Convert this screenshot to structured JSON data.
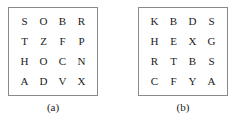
{
  "figure": {
    "panels": [
      {
        "id": "a",
        "caption": "(a)",
        "grid": {
          "rows": 4,
          "cols": 4,
          "cells": [
            [
              "S",
              "O",
              "B",
              "R"
            ],
            [
              "T",
              "Z",
              "F",
              "P"
            ],
            [
              "H",
              "O",
              "C",
              "N"
            ],
            [
              "A",
              "D",
              "V",
              "X"
            ]
          ]
        }
      },
      {
        "id": "b",
        "caption": "(b)",
        "grid": {
          "rows": 4,
          "cols": 4,
          "cells": [
            [
              "K",
              "B",
              "D",
              "S"
            ],
            [
              "H",
              "E",
              "X",
              "G"
            ],
            [
              "R",
              "T",
              "B",
              "S"
            ],
            [
              "C",
              "F",
              "Y",
              "A"
            ]
          ]
        }
      }
    ],
    "colors": {
      "background": "#ffffff",
      "border": "#8a8a8a",
      "text": "#1a1a1a"
    }
  }
}
